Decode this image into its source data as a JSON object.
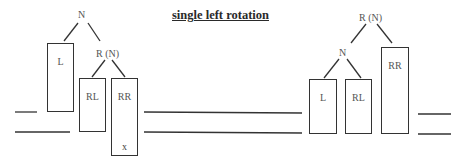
{
  "title": "single left rotation",
  "before": {
    "root_label": "N",
    "child_label": "R (N)",
    "subtrees": [
      {
        "name": "L",
        "extra": ""
      },
      {
        "name": "RL",
        "extra": ""
      },
      {
        "name": "RR",
        "extra": "x"
      }
    ]
  },
  "after": {
    "root_label": "R (N)",
    "child_label": "N",
    "subtrees": [
      {
        "name": "L"
      },
      {
        "name": "RL"
      },
      {
        "name": "RR"
      }
    ]
  },
  "colors": {
    "stroke": "#333333",
    "text": "#555555",
    "background": "#ffffff"
  }
}
